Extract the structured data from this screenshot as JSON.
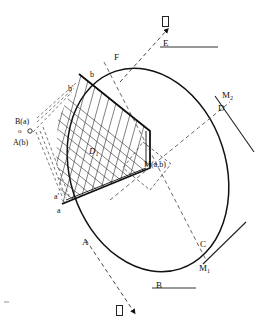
{
  "figure": {
    "type": "geometry-diagram",
    "background_color": "#ffffff",
    "stroke_color": "#111111",
    "hatch_color": "#333333"
  },
  "labels": {
    "ellipse_points": {
      "E": "E",
      "F": "F",
      "D": "D",
      "C": "C",
      "A": "A",
      "B": "B"
    },
    "tangent_points": {
      "M1": "M",
      "M1_sub": "1",
      "M2": "M",
      "M2_sub": "2"
    },
    "center": "M(a,b)",
    "region": "D",
    "region_sub": "1",
    "axis_points": {
      "b": "b",
      "b_prime": "b'",
      "a": "a",
      "a_prime": "a'"
    },
    "left_cluster": {
      "B_of_a": "B(a)",
      "origin": "o",
      "A_of_b": "A(b)"
    },
    "arrow_top_glyph": "tofu-glyph",
    "arrow_bottom_glyph": "tofu-glyph"
  },
  "geometry": {
    "ellipse": {
      "cx": 148,
      "cy": 170,
      "rx": 78,
      "ry": 104,
      "rotation_deg": -18
    },
    "center_point": {
      "x": 144,
      "y": 167
    },
    "tangent_segments": [
      {
        "name": "tangent-at-E",
        "x1": 160,
        "y1": 46,
        "x2": 218,
        "y2": 46
      },
      {
        "name": "tangent-at-B",
        "x1": 152,
        "y1": 287,
        "x2": 196,
        "y2": 287
      },
      {
        "name": "tangent-at-M2",
        "x1": 218,
        "y1": 100,
        "x2": 256,
        "y2": 152
      },
      {
        "name": "tangent-at-M1",
        "x1": 205,
        "y1": 263,
        "x2": 244,
        "y2": 223
      }
    ],
    "dashed_axis_ne": {
      "x1": 115,
      "y1": 196,
      "x2": 228,
      "y2": 104
    },
    "dashed_axis_se": {
      "x1": 105,
      "y1": 63,
      "x2": 205,
      "y2": 258
    }
  }
}
